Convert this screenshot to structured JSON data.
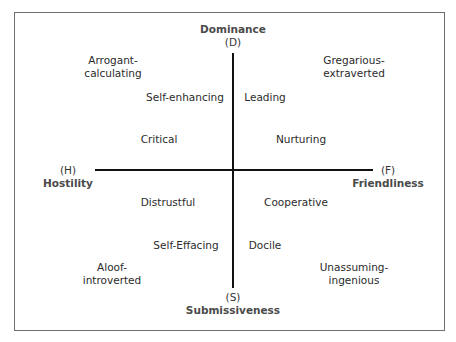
{
  "diagram": {
    "type": "interpersonal-circumplex",
    "axes": {
      "vertical": {
        "top": {
          "code": "(D)",
          "name": "Dominance"
        },
        "bottom": {
          "code": "(S)",
          "name": "Submissiveness"
        }
      },
      "horizontal": {
        "left": {
          "code": "(H)",
          "name": "Hostility"
        },
        "right": {
          "code": "(F)",
          "name": "Friendliness"
        }
      }
    },
    "labels": {
      "arrogant": [
        "Arrogant-",
        "calculating"
      ],
      "gregarious": [
        "Gregarious-",
        "extraverted"
      ],
      "self_enhancing": "Self-enhancing",
      "leading": "Leading",
      "critical": "Critical",
      "nurturing": "Nurturing",
      "distrustful": "Distrustful",
      "cooperative": "Cooperative",
      "self_effacing": "Self-Effacing",
      "docile": "Docile",
      "aloof": [
        "Aloof-",
        "introverted"
      ],
      "unassuming": [
        "Unassuming-",
        "ingenious"
      ]
    }
  }
}
